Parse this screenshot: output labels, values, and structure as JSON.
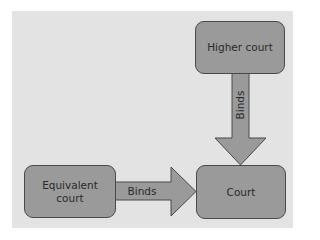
{
  "diagram": {
    "colors": {
      "background": "#e3e3e3",
      "node_fill": "#9a9a9a",
      "node_border": "#4a4a4a",
      "arrow_fill": "#9a9a9a",
      "text": "#2a2a2a"
    },
    "nodes": {
      "higher_court": {
        "label": "Higher court"
      },
      "equivalent_court": {
        "label": "Equivalent court"
      },
      "court": {
        "label": "Court"
      }
    },
    "edges": [
      {
        "from": "higher_court",
        "to": "court",
        "label": "Binds",
        "direction": "down"
      },
      {
        "from": "equivalent_court",
        "to": "court",
        "label": "Binds",
        "direction": "right"
      }
    ]
  }
}
